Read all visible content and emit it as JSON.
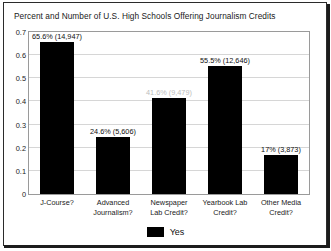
{
  "chart_data": {
    "type": "bar",
    "title": "Percent and Number of U.S. High Schools Offering Journalism Credits",
    "xlabel": "",
    "ylabel": "",
    "ylim": [
      0,
      0.7
    ],
    "grid": true,
    "legend_position": "bottom",
    "categories": [
      "J-Course?",
      "Advanced Journalism?",
      "Newspaper Lab Credit?",
      "Yearbook Lab Credit?",
      "Other Media Credit?"
    ],
    "category_lines": [
      [
        "J-Course?"
      ],
      [
        "Advanced",
        "Journalism?"
      ],
      [
        "Newspaper",
        "Lab Credit?"
      ],
      [
        "Yearbook Lab",
        "Credit?"
      ],
      [
        "Other Media",
        "Credit?"
      ]
    ],
    "series": [
      {
        "name": "Yes",
        "color": "#000000",
        "values": [
          0.656,
          0.246,
          0.416,
          0.555,
          0.17
        ],
        "counts": [
          14947,
          5606,
          9479,
          12646,
          3873
        ],
        "data_labels": [
          "65.6% (14,947)",
          "24.6% (5,606)",
          "41.6% (9,479)",
          "55.5% (12,646)",
          "17% (3,873)"
        ],
        "data_label_faded": [
          false,
          false,
          true,
          false,
          false
        ]
      }
    ],
    "yticks": [
      0,
      0.1,
      0.2,
      0.3,
      0.4,
      0.5,
      0.6,
      0.7
    ],
    "ytick_labels": [
      "0",
      "0.1",
      "0.2",
      "0.3",
      "0.4",
      "0.5",
      "0.6",
      "0.7"
    ],
    "legend": [
      {
        "label": "Yes",
        "color": "#000000"
      }
    ]
  }
}
